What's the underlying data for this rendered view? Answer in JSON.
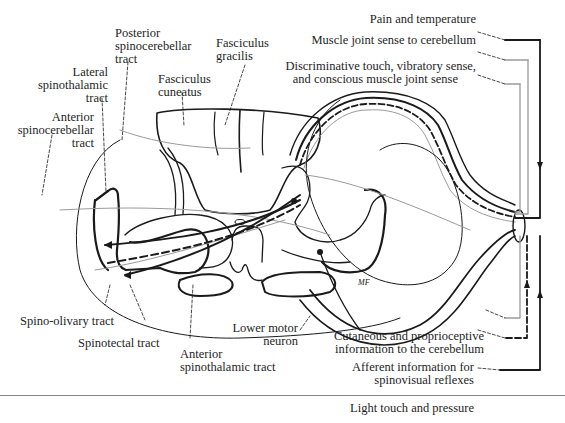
{
  "figure": {
    "colors": {
      "ink": "#1a1a1a",
      "gray_path": "#9a9a9a",
      "background": "#ffffff"
    }
  },
  "labels_left": {
    "posterior_spinocerebellar": [
      "Posterior",
      "spinocerebellar",
      "tract"
    ],
    "lateral_spinothalamic": [
      "Lateral",
      "spinothalamic",
      "tract"
    ],
    "anterior_spinocerebellar": [
      "Anterior",
      "spinocerebellar",
      "tract"
    ],
    "fasciculus_cuneatus": [
      "Fasciculus",
      "cuneatus"
    ],
    "fasciculus_gracilis": [
      "Fasciculus",
      "gracilis"
    ],
    "spino_olivary": "Spino-olivary tract",
    "spinotectal": "Spinotectal tract",
    "anterior_spinothalamic": [
      "Anterior",
      "spinothalamic tract"
    ],
    "lower_motor_neuron": [
      "Lower motor",
      "neuron"
    ]
  },
  "labels_right": {
    "pain_temperature": "Pain and temperature",
    "muscle_joint_cerebellum": "Muscle joint sense to cerebellum",
    "discriminative_touch": [
      "Discriminative touch, vibratory sense,",
      "and conscious muscle joint sense"
    ],
    "cutaneous_proprioceptive": [
      "Cutaneous and proprioceptive",
      "information to the cerebellum"
    ],
    "afferent_spinovisual": [
      "Afferent information for",
      "spinovisual reflexes"
    ],
    "light_touch_pressure": "Light touch and pressure"
  },
  "signature": "MF"
}
